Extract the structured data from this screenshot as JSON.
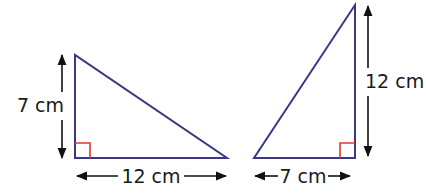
{
  "diagram": {
    "colors": {
      "triangle_stroke": "#3a3886",
      "right_angle_mark": "#e0392b",
      "arrow": "#111111",
      "text": "#1a1a1a"
    },
    "triangles": [
      {
        "id": "left",
        "orientation": "right angle at bottom-left",
        "vertical_side": {
          "label": "7 cm",
          "value": 7,
          "unit": "cm"
        },
        "horizontal_side": {
          "label": "12 cm",
          "value": 12,
          "unit": "cm"
        }
      },
      {
        "id": "right",
        "orientation": "right angle at bottom-right",
        "vertical_side": {
          "label": "12 cm",
          "value": 12,
          "unit": "cm"
        },
        "horizontal_side": {
          "label": "7 cm",
          "value": 7,
          "unit": "cm"
        }
      }
    ]
  }
}
